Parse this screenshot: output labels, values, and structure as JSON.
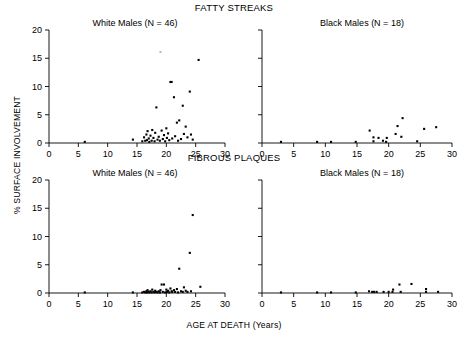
{
  "figure": {
    "row_titles": {
      "fatty": "FATTY STREAKS",
      "fibrous": "FIBROUS PLAQUES"
    },
    "ylabel": "% SURFACE INVOLVEMENT",
    "xlabel": "AGE AT DEATH (Years)",
    "panel_titles": {
      "white": "White Males (N = 46)",
      "black": "Black Males (N = 18)"
    }
  },
  "chart_data": [
    {
      "type": "scatter",
      "title": "FATTY STREAKS",
      "panel": "White Males (N = 46)",
      "xlabel": "AGE AT DEATH (Years)",
      "ylabel": "% SURFACE INVOLVEMENT",
      "xlim": [
        0,
        30
      ],
      "ylim": [
        0,
        20
      ],
      "xticks": [
        0,
        5,
        10,
        15,
        20,
        25,
        30
      ],
      "yticks": [
        0,
        5,
        10,
        15,
        20
      ],
      "grid": false,
      "legend": "none",
      "marker": "filled-square",
      "points": [
        [
          6.1,
          0.2
        ],
        [
          14.3,
          0.6
        ],
        [
          15.9,
          0.3
        ],
        [
          16.2,
          1.0
        ],
        [
          16.4,
          0.4
        ],
        [
          16.6,
          1.5
        ],
        [
          16.7,
          0.5
        ],
        [
          16.8,
          2.1
        ],
        [
          17.0,
          0.8
        ],
        [
          17.1,
          0.2
        ],
        [
          17.3,
          1.3
        ],
        [
          17.5,
          0.4
        ],
        [
          17.6,
          2.3
        ],
        [
          17.8,
          0.9
        ],
        [
          18.0,
          0.3
        ],
        [
          18.1,
          1.8
        ],
        [
          18.3,
          6.3
        ],
        [
          18.5,
          0.6
        ],
        [
          18.7,
          1.1
        ],
        [
          18.9,
          0.4
        ],
        [
          19.0,
          16.1
        ],
        [
          19.2,
          2.2
        ],
        [
          19.4,
          0.7
        ],
        [
          19.6,
          1.4
        ],
        [
          19.8,
          0.3
        ],
        [
          20.0,
          2.6
        ],
        [
          20.1,
          0.9
        ],
        [
          20.3,
          1.7
        ],
        [
          20.5,
          0.5
        ],
        [
          20.7,
          10.8
        ],
        [
          20.9,
          10.8
        ],
        [
          21.0,
          0.8
        ],
        [
          21.3,
          8.1
        ],
        [
          21.5,
          1.2
        ],
        [
          21.8,
          3.6
        ],
        [
          22.0,
          0.4
        ],
        [
          22.2,
          4.0
        ],
        [
          22.5,
          0.7
        ],
        [
          22.8,
          6.6
        ],
        [
          23.0,
          1.6
        ],
        [
          23.3,
          2.9
        ],
        [
          23.6,
          1.0
        ],
        [
          24.0,
          9.1
        ],
        [
          24.2,
          1.5
        ],
        [
          24.5,
          0.6
        ],
        [
          25.5,
          14.7
        ]
      ],
      "faint_points": [
        [
          19.0,
          16.1
        ]
      ]
    },
    {
      "type": "scatter",
      "title": "FATTY STREAKS",
      "panel": "Black Males (N = 18)",
      "xlabel": "AGE AT DEATH (Years)",
      "ylabel": "% SURFACE INVOLVEMENT",
      "xlim": [
        0,
        30
      ],
      "ylim": [
        0,
        20
      ],
      "xticks": [
        0,
        5,
        10,
        15,
        20,
        25,
        30
      ],
      "yticks": [
        0,
        5,
        10,
        15,
        20
      ],
      "grid": false,
      "legend": "none",
      "marker": "filled-square",
      "points": [
        [
          3.0,
          0.2
        ],
        [
          8.7,
          0.2
        ],
        [
          10.9,
          0.2
        ],
        [
          14.8,
          0.2
        ],
        [
          17.0,
          2.2
        ],
        [
          17.6,
          0.3
        ],
        [
          17.6,
          1.0
        ],
        [
          18.4,
          0.9
        ],
        [
          19.1,
          0.4
        ],
        [
          19.6,
          0.2
        ],
        [
          19.7,
          0.9
        ],
        [
          21.1,
          1.6
        ],
        [
          21.4,
          3.0
        ],
        [
          22.2,
          4.4
        ],
        [
          24.5,
          0.3
        ],
        [
          25.6,
          2.5
        ],
        [
          27.5,
          2.8
        ],
        [
          22.0,
          1.1
        ]
      ],
      "faint_points": []
    },
    {
      "type": "scatter",
      "title": "FIBROUS PLAQUES",
      "panel": "White Males (N = 46)",
      "xlabel": "AGE AT DEATH (Years)",
      "ylabel": "% SURFACE INVOLVEMENT",
      "xlim": [
        0,
        30
      ],
      "ylim": [
        0,
        20
      ],
      "xticks": [
        0,
        5,
        10,
        15,
        20,
        25,
        30
      ],
      "yticks": [
        0,
        5,
        10,
        15,
        20
      ],
      "grid": false,
      "legend": "none",
      "marker": "filled-square",
      "points": [
        [
          6.1,
          0.1
        ],
        [
          14.3,
          0.1
        ],
        [
          15.9,
          0.1
        ],
        [
          16.2,
          0.2
        ],
        [
          16.4,
          0.1
        ],
        [
          16.6,
          0.3
        ],
        [
          16.7,
          0.1
        ],
        [
          16.8,
          0.5
        ],
        [
          17.0,
          0.2
        ],
        [
          17.1,
          0.1
        ],
        [
          17.3,
          0.3
        ],
        [
          17.5,
          0.1
        ],
        [
          17.6,
          0.6
        ],
        [
          17.8,
          0.2
        ],
        [
          18.0,
          0.1
        ],
        [
          18.1,
          0.4
        ],
        [
          18.3,
          0.2
        ],
        [
          18.5,
          0.1
        ],
        [
          18.7,
          0.3
        ],
        [
          18.9,
          0.1
        ],
        [
          19.0,
          0.5
        ],
        [
          19.2,
          1.5
        ],
        [
          19.4,
          0.2
        ],
        [
          19.6,
          1.5
        ],
        [
          19.8,
          0.1
        ],
        [
          20.0,
          0.6
        ],
        [
          20.1,
          0.2
        ],
        [
          20.3,
          0.4
        ],
        [
          20.5,
          0.1
        ],
        [
          20.7,
          0.8
        ],
        [
          20.9,
          0.3
        ],
        [
          21.0,
          0.2
        ],
        [
          21.3,
          0.5
        ],
        [
          21.5,
          0.2
        ],
        [
          21.8,
          0.7
        ],
        [
          22.0,
          0.1
        ],
        [
          22.2,
          4.3
        ],
        [
          22.5,
          0.3
        ],
        [
          22.8,
          0.2
        ],
        [
          23.0,
          1.0
        ],
        [
          23.3,
          0.4
        ],
        [
          23.6,
          0.2
        ],
        [
          24.0,
          7.1
        ],
        [
          24.2,
          0.3
        ],
        [
          24.5,
          13.8
        ],
        [
          25.8,
          1.1
        ]
      ],
      "faint_points": []
    },
    {
      "type": "scatter",
      "title": "FIBROUS PLAQUES",
      "panel": "Black Males (N = 18)",
      "xlabel": "AGE AT DEATH (Years)",
      "ylabel": "% SURFACE INVOLVEMENT",
      "xlim": [
        0,
        30
      ],
      "ylim": [
        0,
        20
      ],
      "xticks": [
        0,
        5,
        10,
        15,
        20,
        25,
        30
      ],
      "yticks": [
        0,
        5,
        10,
        15,
        20
      ],
      "grid": false,
      "legend": "none",
      "marker": "filled-square",
      "points": [
        [
          3.0,
          0.1
        ],
        [
          8.7,
          0.1
        ],
        [
          10.9,
          0.1
        ],
        [
          14.8,
          0.1
        ],
        [
          16.9,
          0.3
        ],
        [
          17.4,
          0.2
        ],
        [
          17.7,
          0.2
        ],
        [
          18.1,
          0.2
        ],
        [
          19.2,
          0.2
        ],
        [
          20.0,
          0.2
        ],
        [
          20.6,
          0.2
        ],
        [
          20.7,
          0.6
        ],
        [
          21.7,
          1.5
        ],
        [
          21.9,
          0.2
        ],
        [
          23.6,
          1.6
        ],
        [
          25.9,
          0.2
        ],
        [
          25.9,
          0.7
        ],
        [
          27.8,
          0.2
        ]
      ],
      "faint_points": []
    }
  ]
}
